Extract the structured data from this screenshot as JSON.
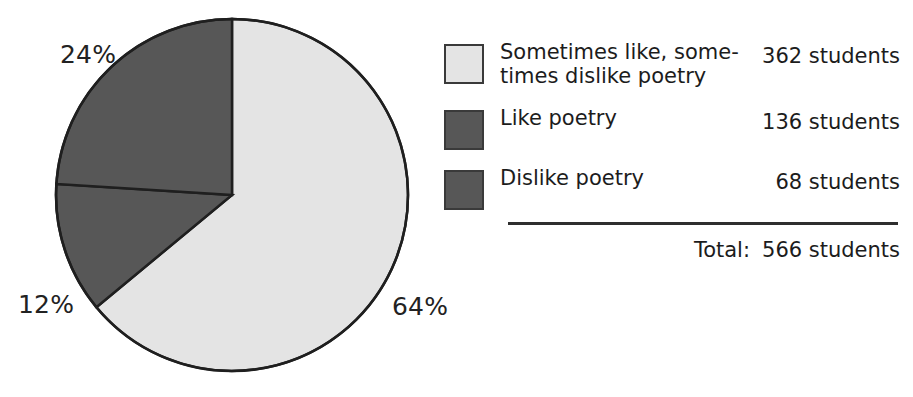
{
  "chart_data": {
    "type": "pie",
    "title": "",
    "subtitle": "",
    "xlabel": "",
    "ylabel": "",
    "grid": false,
    "legend_position": "right",
    "unit": "students",
    "categories": [
      "Sometimes like, sometimes dislike poetry",
      "Like poetry",
      "Dislike poetry"
    ],
    "values": [
      362,
      136,
      68
    ],
    "percentages": [
      64,
      24,
      12
    ],
    "percent_labels": [
      "64%",
      "24%",
      "12%"
    ],
    "colors": [
      "#e4e4e4",
      "#575757",
      "#575757"
    ],
    "total": 566,
    "total_label_text": "Total:",
    "total_value_text": "566 students",
    "slices": [
      {
        "label_line1": "Sometimes like, some-",
        "label_line2": "times dislike poetry",
        "value_text": "362 students",
        "percent_text": "64%",
        "value": 362,
        "percent": 64,
        "color": "#e4e4e4",
        "swatch_style": "light"
      },
      {
        "label_line1": "Like poetry",
        "label_line2": "",
        "value_text": "136 students",
        "percent_text": "24%",
        "value": 136,
        "percent": 24,
        "color": "#575757",
        "swatch_style": "dark"
      },
      {
        "label_line1": "Dislike poetry",
        "label_line2": "",
        "value_text": "68 students",
        "percent_text": "12%",
        "value": 68,
        "percent": 12,
        "color": "#575757",
        "swatch_style": "dark"
      }
    ]
  },
  "pie": {
    "center_x": 232,
    "center_y": 195,
    "radius": 176,
    "outline_color": "#1f1f1f",
    "pct_24": "24%",
    "pct_12": "12%",
    "pct_64": "64%"
  },
  "legend": {
    "rows": [
      {
        "label_line1": "Sometimes like, some-",
        "label_line2": "times dislike poetry",
        "value": "362 students"
      },
      {
        "label_line1": "Like poetry",
        "label_line2": "",
        "value": "136 students"
      },
      {
        "label_line1": "Dislike poetry",
        "label_line2": "",
        "value": "68 students"
      }
    ],
    "total_label": "Total:",
    "total_value": "566 students"
  }
}
